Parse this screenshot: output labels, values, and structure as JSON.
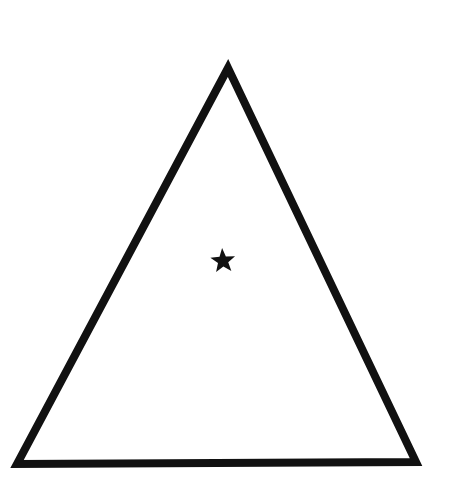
{
  "image": {
    "title": "Triangle outline with centered five-pointed star",
    "width": 453,
    "height": 487,
    "background_color": "#ffffff",
    "ink_color": "#0d0d0d",
    "medium": "scanned line drawing",
    "caption": ""
  },
  "shapes": {
    "triangle": {
      "name": "triangle",
      "type": "polygon-outline",
      "sides": 3,
      "fill": "none",
      "stroke_color": "#111111",
      "stroke_width": 8,
      "orientation": "point-up",
      "vertices": [
        {
          "label": "apex",
          "x": 228,
          "y": 68
        },
        {
          "label": "bottom-right",
          "x": 416,
          "y": 462
        },
        {
          "label": "bottom-left",
          "x": 17,
          "y": 464
        }
      ],
      "approx_base_px": 399,
      "approx_height_px": 395
    },
    "star": {
      "name": "star",
      "type": "polygon-filled",
      "points": 5,
      "fill": "#111111",
      "stroke_color": "none",
      "orientation": "point-up",
      "center": {
        "x": 223,
        "y": 261
      },
      "outer_radius": 13,
      "inner_radius": 5.4,
      "rotation_deg": -4,
      "bounds": {
        "x": 210,
        "y": 248,
        "width": 26,
        "height": 25
      }
    }
  },
  "labels": {
    "alt_text": "A large black outlined triangle pointing upward with a small solid black five-pointed star near its center"
  }
}
